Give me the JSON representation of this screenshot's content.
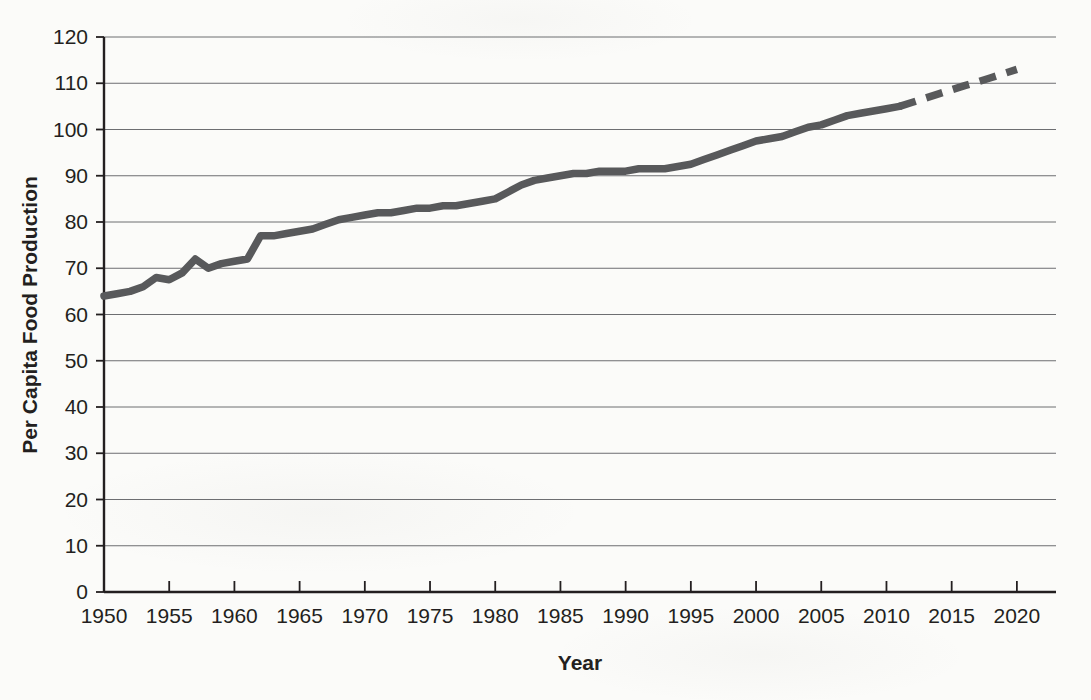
{
  "chart_data": {
    "type": "line",
    "title": "",
    "subtitle": "",
    "xlabel": "Year",
    "ylabel": "Per Capita Food Production",
    "xlim": [
      1950,
      2023
    ],
    "ylim": [
      0,
      120
    ],
    "xticks": [
      1950,
      1955,
      1960,
      1965,
      1970,
      1975,
      1980,
      1985,
      1990,
      1995,
      2000,
      2005,
      2010,
      2015,
      2020
    ],
    "yticks": [
      0,
      10,
      20,
      30,
      40,
      50,
      60,
      70,
      80,
      90,
      100,
      110,
      120
    ],
    "grid": "horizontal",
    "legend": "none",
    "annotations": [],
    "series": [
      {
        "name": "Per Capita Food Production (observed)",
        "style": "solid",
        "color": "#58595b",
        "x": [
          1950,
          1951,
          1952,
          1953,
          1954,
          1955,
          1956,
          1957,
          1958,
          1959,
          1960,
          1961,
          1962,
          1963,
          1964,
          1965,
          1966,
          1967,
          1968,
          1969,
          1970,
          1971,
          1972,
          1973,
          1974,
          1975,
          1976,
          1977,
          1978,
          1979,
          1980,
          1981,
          1982,
          1983,
          1984,
          1985,
          1986,
          1987,
          1988,
          1989,
          1990,
          1991,
          1992,
          1993,
          1994,
          1995,
          1996,
          1997,
          1998,
          1999,
          2000,
          2001,
          2002,
          2003,
          2004,
          2005,
          2006,
          2007,
          2008,
          2009,
          2010,
          2011
        ],
        "values": [
          64,
          64.5,
          65,
          66,
          68,
          67.5,
          69,
          72,
          70,
          71,
          71.5,
          72,
          77,
          77,
          77.5,
          78,
          78.5,
          79.5,
          80.5,
          81,
          81.5,
          82,
          82,
          82.5,
          83,
          83,
          83.5,
          83.5,
          84,
          84.5,
          85,
          86.5,
          88,
          89,
          89.5,
          90,
          90.5,
          90.5,
          91,
          91,
          91,
          91.5,
          91.5,
          91.5,
          92,
          92.5,
          93.5,
          94.5,
          95.5,
          96.5,
          97.5,
          98,
          98.5,
          99.5,
          100.5,
          101,
          102,
          103,
          103.5,
          104,
          104.5,
          105
        ]
      },
      {
        "name": "Per Capita Food Production (projected)",
        "style": "dashed",
        "color": "#58595b",
        "x": [
          2011,
          2012,
          2013,
          2014,
          2015,
          2016,
          2017,
          2018,
          2019,
          2020
        ],
        "values": [
          105,
          105.9,
          106.8,
          107.7,
          108.6,
          109.5,
          110.3,
          111.2,
          112.1,
          113
        ]
      }
    ]
  },
  "axes": {
    "y_title": "Per Capita Food Production",
    "x_title": "Year"
  }
}
